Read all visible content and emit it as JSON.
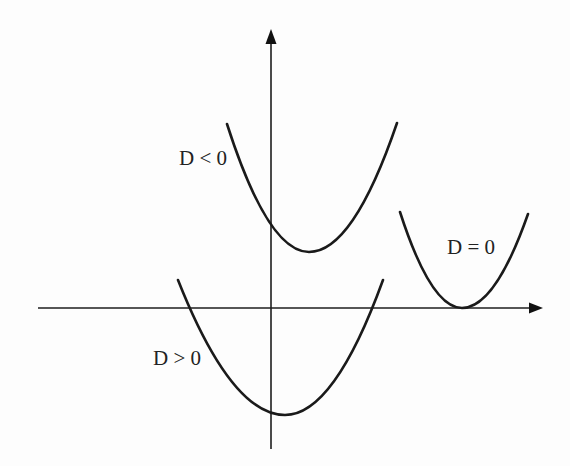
{
  "diagram": {
    "labels": {
      "d_negative": "D < 0",
      "d_zero": "D = 0",
      "d_positive": "D > 0"
    },
    "axes": {
      "x_axis": {
        "from": [
          38,
          308
        ],
        "to": [
          542,
          308
        ]
      },
      "y_axis": {
        "from": [
          271,
          449
        ],
        "to": [
          271,
          30
        ]
      }
    },
    "curves": [
      {
        "name": "D < 0",
        "left_top": [
          227,
          124
        ],
        "vertex": [
          309,
          252
        ],
        "right_top": [
          397,
          123
        ],
        "roots": 0
      },
      {
        "name": "D = 0",
        "left_top": [
          400,
          212
        ],
        "vertex": [
          462,
          308
        ],
        "right_top": [
          528,
          214
        ],
        "roots": 1
      },
      {
        "name": "D > 0",
        "left_top": [
          178,
          280
        ],
        "vertex": [
          285,
          415
        ],
        "right_top": [
          383,
          280
        ],
        "roots": 2
      }
    ],
    "colors": {
      "ink": "#1a1a1a",
      "background": "#fdfdfd"
    }
  }
}
